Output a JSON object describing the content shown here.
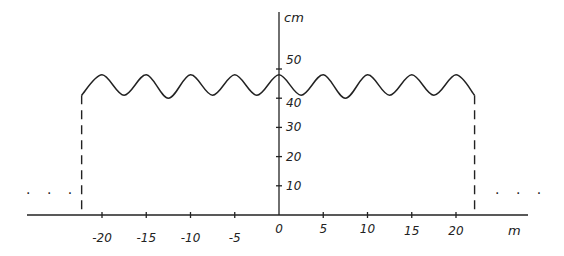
{
  "chart_data": {
    "type": "line",
    "title": "",
    "xlabel": "m",
    "ylabel": "cm",
    "x_ticks": [
      -20,
      -15,
      -10,
      -5,
      0,
      5,
      10,
      15,
      20
    ],
    "x_tick_labels": [
      "-20",
      "-15",
      "-10",
      "-5",
      "0",
      "5",
      "10",
      "15",
      "20"
    ],
    "y_ticks": [
      10,
      20,
      30,
      40,
      50
    ],
    "y_tick_labels": [
      "10",
      "20",
      "30",
      "40",
      "50"
    ],
    "xlim": [
      -30,
      30
    ],
    "ylim": [
      0,
      60
    ],
    "grid": false,
    "legend": null,
    "series": [
      {
        "name": "wave profile",
        "style": "solid",
        "description": "Sinusoidal surface oscillating between ~40 cm and ~48 cm with period ~5 m, spanning x ≈ -22 m to x ≈ 22 m",
        "x": [
          -22.3,
          -20,
          -17.5,
          -15,
          -12.5,
          -10,
          -7.5,
          -5,
          -2.5,
          0,
          2.5,
          5,
          7.5,
          10,
          12.5,
          15,
          17.5,
          20,
          22.1
        ],
        "y": [
          41,
          48,
          41,
          48,
          40,
          48,
          41,
          48,
          41,
          48,
          41,
          48,
          40,
          48,
          41,
          48,
          41,
          48,
          41
        ]
      },
      {
        "name": "left boundary",
        "style": "dashed",
        "x": [
          -22.3,
          -22.3
        ],
        "y": [
          0,
          41
        ]
      },
      {
        "name": "right boundary",
        "style": "dashed",
        "x": [
          22.1,
          22.1
        ],
        "y": [
          0,
          41
        ]
      }
    ],
    "annotations": [
      {
        "text": "...",
        "position": "left of left boundary, near baseline"
      },
      {
        "text": "...",
        "position": "right of right boundary, near baseline"
      }
    ]
  },
  "labels": {
    "y_unit": "cm",
    "x_unit": "m",
    "ellipsis": "· · ·"
  }
}
